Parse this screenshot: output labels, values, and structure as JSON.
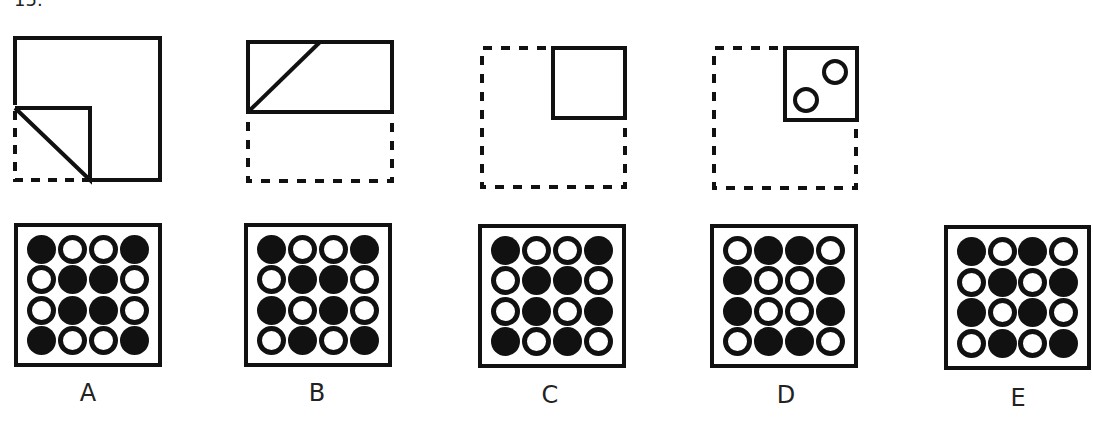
{
  "question": {
    "number": "15."
  },
  "folding_steps": [
    {
      "id": "step-1",
      "description": "square with bottom-left corner folded diagonally up"
    },
    {
      "id": "step-2",
      "description": "folded in half upward, diagonal crease visible"
    },
    {
      "id": "step-3",
      "description": "folded again to top-right quarter"
    },
    {
      "id": "step-4",
      "description": "two holes punched in folded square"
    }
  ],
  "options": [
    {
      "label": "A",
      "grid": [
        [
          "F",
          "O",
          "O",
          "F"
        ],
        [
          "O",
          "F",
          "F",
          "O"
        ],
        [
          "O",
          "F",
          "F",
          "O"
        ],
        [
          "F",
          "O",
          "O",
          "F"
        ]
      ]
    },
    {
      "label": "B",
      "grid": [
        [
          "F",
          "O",
          "O",
          "F"
        ],
        [
          "O",
          "F",
          "F",
          "O"
        ],
        [
          "F",
          "O",
          "F",
          "O"
        ],
        [
          "O",
          "F",
          "O",
          "F"
        ]
      ]
    },
    {
      "label": "C",
      "grid": [
        [
          "F",
          "O",
          "O",
          "F"
        ],
        [
          "O",
          "F",
          "F",
          "O"
        ],
        [
          "O",
          "F",
          "O",
          "F"
        ],
        [
          "F",
          "O",
          "F",
          "O"
        ]
      ]
    },
    {
      "label": "D",
      "grid": [
        [
          "O",
          "F",
          "F",
          "O"
        ],
        [
          "F",
          "O",
          "O",
          "F"
        ],
        [
          "F",
          "O",
          "O",
          "F"
        ],
        [
          "O",
          "F",
          "F",
          "O"
        ]
      ]
    },
    {
      "label": "E",
      "grid": [
        [
          "F",
          "O",
          "F",
          "O"
        ],
        [
          "O",
          "F",
          "O",
          "F"
        ],
        [
          "F",
          "O",
          "F",
          "O"
        ],
        [
          "O",
          "F",
          "O",
          "F"
        ]
      ]
    }
  ],
  "legend": {
    "F": "filled circle",
    "O": "open circle"
  },
  "colors": {
    "ink": "#111111",
    "background": "#ffffff"
  }
}
